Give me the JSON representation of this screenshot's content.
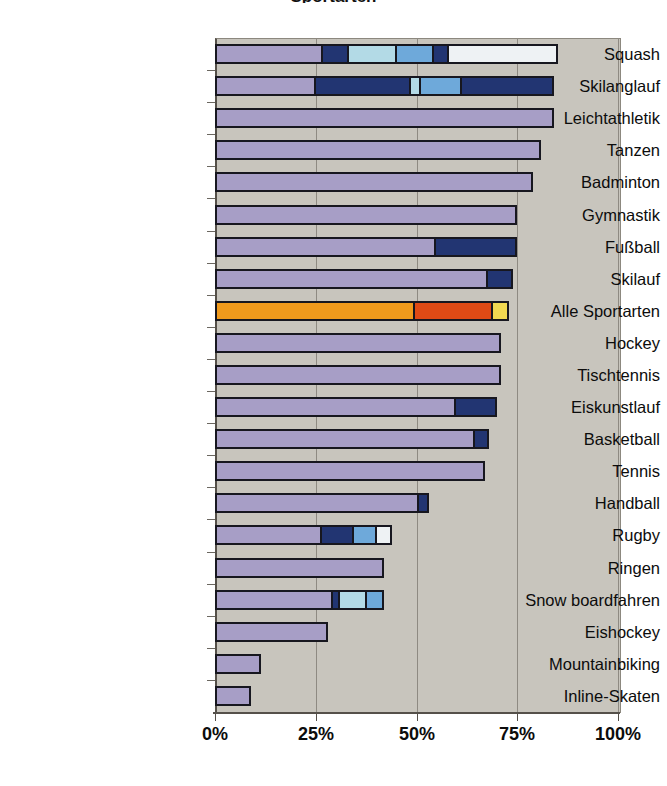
{
  "chart_data": {
    "type": "bar",
    "orientation": "horizontal",
    "stacked": true,
    "title": "Sportarten",
    "xlabel": "",
    "ylabel": "",
    "xlim": [
      0,
      100
    ],
    "xticks": [
      0,
      25,
      50,
      75,
      100
    ],
    "xticklabels": [
      "0%",
      "25%",
      "50%",
      "75%",
      "100%"
    ],
    "grid": true,
    "grid_axis": "x",
    "legend": false,
    "plot_background": "#c8c5bd",
    "categories": [
      "Squash",
      "Skilanglauf",
      "Leichtathletik",
      "Tanzen",
      "Badminton",
      "Gymnastik",
      "Fußball",
      "Skilauf",
      "Alle Sportarten",
      "Hockey",
      "Tischtennis",
      "Eiskunstlauf",
      "Basketball",
      "Tennis",
      "Handball",
      "Rugby",
      "Ringen",
      "Snow boardfahren",
      "Eishockey",
      "Mountainbiking",
      "Inline-Skaten"
    ],
    "totals": [
      85,
      84,
      84,
      81,
      79,
      75,
      75,
      74,
      73,
      71,
      71,
      70,
      68,
      67,
      53,
      44,
      42,
      42,
      28,
      11.5,
      9
    ],
    "colors": {
      "light_purple": "#a79ec6",
      "dark_navy": "#223572",
      "light_cyan": "#b3dae6",
      "medium_blue": "#6ea9da",
      "white": "#eef2f4",
      "orange": "#f09a1c",
      "red_orange": "#df4a15",
      "yellow": "#f1d851"
    },
    "bars": [
      {
        "category": "Squash",
        "total": 85,
        "segments": [
          {
            "color": "light_purple",
            "start": 0,
            "end": 27,
            "value": 27
          },
          {
            "color": "dark_navy",
            "start": 27,
            "end": 33,
            "value": 6
          },
          {
            "color": "light_cyan",
            "start": 33,
            "end": 45,
            "value": 12
          },
          {
            "color": "medium_blue",
            "start": 45,
            "end": 54,
            "value": 9
          },
          {
            "color": "dark_navy",
            "start": 54,
            "end": 57.5,
            "value": 3.5
          },
          {
            "color": "white",
            "start": 57.5,
            "end": 85,
            "value": 27.5
          }
        ]
      },
      {
        "category": "Skilanglauf",
        "total": 84,
        "segments": [
          {
            "color": "light_purple",
            "start": 0,
            "end": 25,
            "value": 25
          },
          {
            "color": "dark_navy",
            "start": 25,
            "end": 49,
            "value": 24
          },
          {
            "color": "light_cyan",
            "start": 49,
            "end": 51,
            "value": 2
          },
          {
            "color": "medium_blue",
            "start": 51,
            "end": 61,
            "value": 10
          },
          {
            "color": "dark_navy",
            "start": 61,
            "end": 84,
            "value": 23
          }
        ]
      },
      {
        "category": "Leichtathletik",
        "total": 84,
        "segments": [
          {
            "color": "light_purple",
            "start": 0,
            "end": 84,
            "value": 84
          }
        ]
      },
      {
        "category": "Tanzen",
        "total": 81,
        "segments": [
          {
            "color": "light_purple",
            "start": 0,
            "end": 81,
            "value": 81
          }
        ]
      },
      {
        "category": "Badminton",
        "total": 79,
        "segments": [
          {
            "color": "light_purple",
            "start": 0,
            "end": 79,
            "value": 79
          }
        ]
      },
      {
        "category": "Gymnastik",
        "total": 75,
        "segments": [
          {
            "color": "light_purple",
            "start": 0,
            "end": 75,
            "value": 75
          }
        ]
      },
      {
        "category": "Fußball",
        "total": 75,
        "segments": [
          {
            "color": "light_purple",
            "start": 0,
            "end": 55,
            "value": 55
          },
          {
            "color": "dark_navy",
            "start": 55,
            "end": 75,
            "value": 20
          }
        ]
      },
      {
        "category": "Skilauf",
        "total": 74,
        "segments": [
          {
            "color": "light_purple",
            "start": 0,
            "end": 68,
            "value": 68
          },
          {
            "color": "dark_navy",
            "start": 68,
            "end": 74,
            "value": 6
          }
        ]
      },
      {
        "category": "Alle Sportarten",
        "total": 73,
        "segments": [
          {
            "color": "orange",
            "start": 0,
            "end": 50,
            "value": 50
          },
          {
            "color": "red_orange",
            "start": 50,
            "end": 69.5,
            "value": 19.5
          },
          {
            "color": "yellow",
            "start": 69.5,
            "end": 73,
            "value": 3.5
          }
        ]
      },
      {
        "category": "Hockey",
        "total": 71,
        "segments": [
          {
            "color": "light_purple",
            "start": 0,
            "end": 71,
            "value": 71
          }
        ]
      },
      {
        "category": "Tischtennis",
        "total": 71,
        "segments": [
          {
            "color": "light_purple",
            "start": 0,
            "end": 71,
            "value": 71
          }
        ]
      },
      {
        "category": "Eiskunstlauf",
        "total": 70,
        "segments": [
          {
            "color": "light_purple",
            "start": 0,
            "end": 60,
            "value": 60
          },
          {
            "color": "dark_navy",
            "start": 60,
            "end": 70,
            "value": 10
          }
        ]
      },
      {
        "category": "Basketball",
        "total": 68,
        "segments": [
          {
            "color": "light_purple",
            "start": 0,
            "end": 65,
            "value": 65
          },
          {
            "color": "dark_navy",
            "start": 65,
            "end": 68,
            "value": 3
          }
        ]
      },
      {
        "category": "Tennis",
        "total": 67,
        "segments": [
          {
            "color": "light_purple",
            "start": 0,
            "end": 67,
            "value": 67
          }
        ]
      },
      {
        "category": "Handball",
        "total": 53,
        "segments": [
          {
            "color": "light_purple",
            "start": 0,
            "end": 51,
            "value": 51
          },
          {
            "color": "dark_navy",
            "start": 51,
            "end": 53,
            "value": 2
          }
        ]
      },
      {
        "category": "Rugby",
        "total": 44,
        "segments": [
          {
            "color": "light_purple",
            "start": 0,
            "end": 27,
            "value": 27
          },
          {
            "color": "dark_navy",
            "start": 27,
            "end": 35,
            "value": 8
          },
          {
            "color": "medium_blue",
            "start": 35,
            "end": 40.5,
            "value": 5.5
          },
          {
            "color": "white",
            "start": 40.5,
            "end": 44,
            "value": 3.5
          }
        ]
      },
      {
        "category": "Ringen",
        "total": 42,
        "segments": [
          {
            "color": "light_purple",
            "start": 0,
            "end": 42,
            "value": 42
          }
        ]
      },
      {
        "category": "Snow boardfahren",
        "total": 42,
        "segments": [
          {
            "color": "light_purple",
            "start": 0,
            "end": 30,
            "value": 30
          },
          {
            "color": "dark_navy",
            "start": 30,
            "end": 31.5,
            "value": 1.5
          },
          {
            "color": "light_cyan",
            "start": 31.5,
            "end": 38,
            "value": 6.5
          },
          {
            "color": "medium_blue",
            "start": 38,
            "end": 42,
            "value": 4
          }
        ]
      },
      {
        "category": "Eishockey",
        "total": 28,
        "segments": [
          {
            "color": "light_purple",
            "start": 0,
            "end": 28,
            "value": 28
          }
        ]
      },
      {
        "category": "Mountainbiking",
        "total": 11.5,
        "segments": [
          {
            "color": "light_purple",
            "start": 0,
            "end": 11.5,
            "value": 11.5
          }
        ]
      },
      {
        "category": "Inline-Skaten",
        "total": 9,
        "segments": [
          {
            "color": "light_purple",
            "start": 0,
            "end": 9,
            "value": 9
          }
        ]
      }
    ]
  }
}
